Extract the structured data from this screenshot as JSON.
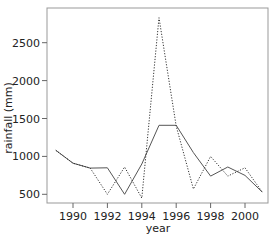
{
  "chart_data": {
    "type": "line",
    "title": "",
    "xlabel": "year",
    "ylabel": "rainfall (mm)",
    "x": [
      1989,
      1990,
      1991,
      1992,
      1993,
      1994,
      1995,
      1996,
      1997,
      1998,
      1999,
      2000,
      2001
    ],
    "series": [
      {
        "name": "solid",
        "style": "solid",
        "values": [
          1080,
          910,
          845,
          850,
          500,
          900,
          1410,
          1410,
          1050,
          740,
          860,
          750,
          530
        ]
      },
      {
        "name": "dotted",
        "style": "dotted",
        "values": [
          1080,
          910,
          845,
          500,
          860,
          450,
          2830,
          1400,
          570,
          1000,
          740,
          850,
          530
        ]
      }
    ],
    "xticks": [
      1990,
      1992,
      1994,
      1996,
      1998,
      2000
    ],
    "yticks": [
      500,
      1000,
      1500,
      2000,
      2500
    ],
    "xlim": [
      1988.1,
      2001.4
    ],
    "ylim": [
      375,
      3000
    ],
    "grid": false,
    "legend": null
  },
  "axes": {
    "xlabel": "year",
    "ylabel": "rainfall (mm)",
    "xtick_labels": [
      "1990",
      "1992",
      "1994",
      "1996",
      "1998",
      "2000"
    ],
    "ytick_labels": [
      "500",
      "1000",
      "1500",
      "2000",
      "2500"
    ]
  }
}
